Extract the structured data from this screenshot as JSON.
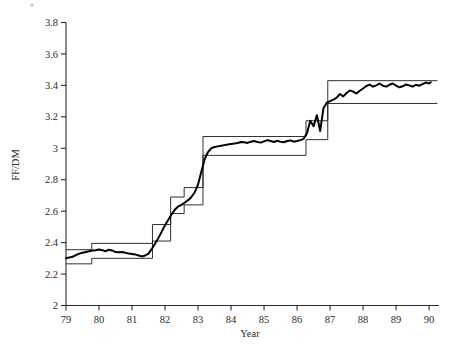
{
  "chart_data": {
    "type": "line",
    "title": "",
    "xlabel": "Year",
    "ylabel": "FF/DM",
    "xlim": [
      79,
      90.3
    ],
    "ylim": [
      2,
      3.8
    ],
    "xticks": [
      79,
      80,
      81,
      82,
      83,
      84,
      85,
      86,
      87,
      88,
      89,
      90
    ],
    "xticklabels": [
      "79",
      "80",
      "81",
      "82",
      "83",
      "84",
      "85",
      "86",
      "87",
      "88",
      "89",
      "90"
    ],
    "yticks": [
      2,
      2.2,
      2.4,
      2.6,
      2.8,
      3,
      3.2,
      3.4,
      3.6,
      3.8
    ],
    "yticklabels": [
      "2",
      "2.2",
      "2.4",
      "2.6",
      "2.8",
      "3",
      "3.2",
      "3.4",
      "3.6",
      "3.8"
    ],
    "grid": false,
    "legend": null,
    "series": [
      {
        "name": "upper-band",
        "kind": "step",
        "color": "#1a1a1a",
        "x": [
          79.0,
          79.78,
          79.78,
          81.62,
          81.62,
          82.17,
          82.17,
          82.58,
          82.58,
          83.15,
          83.15,
          86.27,
          86.27,
          86.93,
          86.93,
          90.25
        ],
        "y": [
          2.355,
          2.355,
          2.395,
          2.395,
          2.515,
          2.515,
          2.69,
          2.69,
          2.75,
          2.75,
          3.075,
          3.075,
          3.175,
          3.175,
          3.43,
          3.43
        ]
      },
      {
        "name": "lower-band",
        "kind": "step",
        "color": "#1a1a1a",
        "x": [
          79.0,
          79.78,
          79.78,
          81.62,
          81.62,
          82.17,
          82.17,
          82.58,
          82.58,
          83.15,
          83.15,
          86.27,
          86.27,
          86.93,
          86.93,
          90.25
        ],
        "y": [
          2.265,
          2.265,
          2.3,
          2.3,
          2.41,
          2.41,
          2.585,
          2.585,
          2.64,
          2.64,
          2.955,
          2.955,
          3.055,
          3.055,
          3.285,
          3.285
        ]
      },
      {
        "name": "ff-dm-exchange-rate",
        "kind": "line",
        "color": "#000000",
        "x": [
          79.0,
          79.1,
          79.2,
          79.3,
          79.4,
          79.5,
          79.6,
          79.7,
          79.8,
          79.9,
          80.0,
          80.1,
          80.2,
          80.3,
          80.4,
          80.5,
          80.6,
          80.7,
          80.8,
          80.9,
          81.0,
          81.1,
          81.2,
          81.3,
          81.4,
          81.5,
          81.6,
          81.7,
          81.8,
          81.9,
          82.0,
          82.1,
          82.2,
          82.3,
          82.4,
          82.5,
          82.6,
          82.7,
          82.8,
          82.9,
          83.0,
          83.1,
          83.2,
          83.3,
          83.4,
          83.5,
          83.6,
          83.7,
          83.8,
          83.9,
          84.0,
          84.1,
          84.2,
          84.3,
          84.4,
          84.5,
          84.6,
          84.7,
          84.8,
          84.9,
          85.0,
          85.1,
          85.2,
          85.3,
          85.4,
          85.5,
          85.6,
          85.7,
          85.8,
          85.9,
          86.0,
          86.1,
          86.2,
          86.3,
          86.4,
          86.5,
          86.6,
          86.7,
          86.8,
          86.9,
          87.0,
          87.1,
          87.2,
          87.3,
          87.4,
          87.5,
          87.6,
          87.7,
          87.8,
          87.9,
          88.0,
          88.1,
          88.2,
          88.3,
          88.4,
          88.5,
          88.6,
          88.7,
          88.8,
          88.9,
          89.0,
          89.1,
          89.2,
          89.3,
          89.4,
          89.5,
          89.6,
          89.7,
          89.8,
          89.9,
          90.0,
          90.05
        ],
        "y": [
          2.3,
          2.305,
          2.31,
          2.32,
          2.33,
          2.335,
          2.34,
          2.345,
          2.35,
          2.352,
          2.356,
          2.352,
          2.345,
          2.355,
          2.35,
          2.34,
          2.338,
          2.34,
          2.335,
          2.33,
          2.328,
          2.325,
          2.318,
          2.312,
          2.318,
          2.33,
          2.36,
          2.395,
          2.43,
          2.47,
          2.51,
          2.545,
          2.58,
          2.61,
          2.63,
          2.64,
          2.655,
          2.67,
          2.69,
          2.72,
          2.77,
          2.85,
          2.93,
          2.975,
          3.0,
          3.008,
          3.012,
          3.016,
          3.02,
          3.024,
          3.028,
          3.03,
          3.034,
          3.04,
          3.038,
          3.034,
          3.042,
          3.046,
          3.04,
          3.036,
          3.044,
          3.052,
          3.046,
          3.04,
          3.048,
          3.042,
          3.038,
          3.046,
          3.05,
          3.042,
          3.046,
          3.052,
          3.06,
          3.095,
          3.175,
          3.14,
          3.21,
          3.11,
          3.255,
          3.29,
          3.3,
          3.31,
          3.322,
          3.345,
          3.33,
          3.352,
          3.368,
          3.36,
          3.348,
          3.366,
          3.38,
          3.396,
          3.405,
          3.392,
          3.4,
          3.412,
          3.398,
          3.392,
          3.404,
          3.412,
          3.398,
          3.388,
          3.394,
          3.406,
          3.4,
          3.392,
          3.404,
          3.398,
          3.408,
          3.418,
          3.412,
          3.42
        ]
      }
    ]
  }
}
